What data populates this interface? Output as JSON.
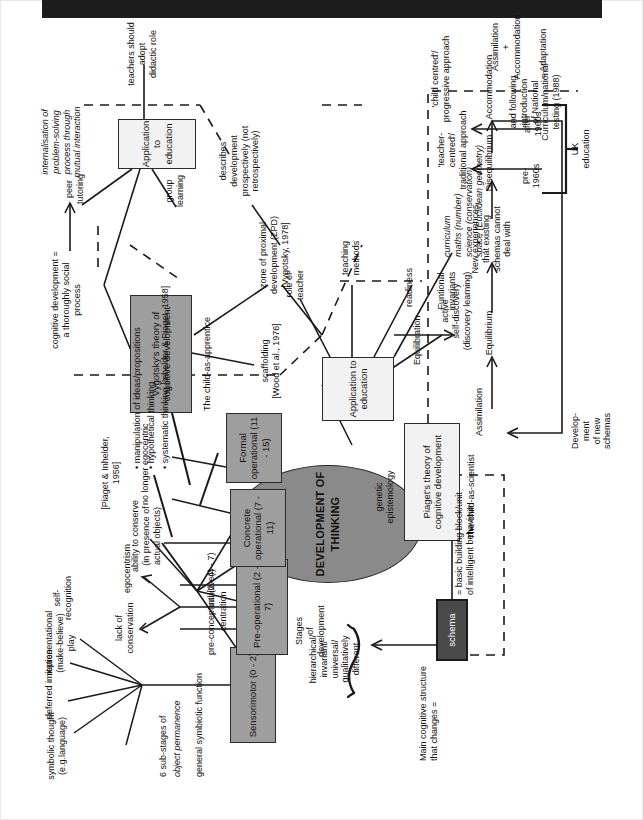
{
  "document": {
    "type": "concept-map",
    "orientation": "rotated-90-ccw",
    "scan_bar": "black-scan-edge"
  },
  "central": {
    "title": "DEVELOPMENT\nOF\nTHINKING"
  },
  "theories": {
    "piaget": {
      "box": "Piaget's theory of\ncognitive\ndevelopment",
      "metaphor": "The child-as-scientist",
      "epistemology": "genetic\nepistemology"
    },
    "vygotsky": {
      "box": "Vygotsky's theory of\ncognitive\ndevelopment",
      "metaphor": "The child-as-apprentice",
      "definition": "cognitive development =\na thoroughly social\nprocess",
      "definition2": "internalisation of\nproblem-solving\nprocess through\nmutual interaction"
    }
  },
  "schema": {
    "box": "schema",
    "main_structure": "Main cognitive structure\nthat changes =",
    "basic_unit": "= basic  building block/unit\nof intelligent behaviour"
  },
  "stages": {
    "heading": "Stages\nof\ndevelopment",
    "qualities": "hierarchical/\ninvariant/\nuniversal/\nqualitatively\ndifferent",
    "items": [
      {
        "name": "Sensorimotor\n(0 - 2)",
        "notes": [
          "6 sub-stages of",
          "object permanence",
          "general symbiotic function"
        ],
        "branches": [
          "symbolic thought\n(e.g.language)",
          "deferred imitation",
          "representational\n(make-believe)\nplay",
          "self-\nrecognition"
        ]
      },
      {
        "name": "Pre-operational\n(2 - 7)",
        "sub": [
          "pre-conceptual (2 - 4)",
          "centration",
          "intuitive(4 - 7)"
        ],
        "branches": [
          "lack of\nconservation",
          "egocentrism"
        ],
        "citation": "[Piaget & Inhelder,\n1956]"
      },
      {
        "name": "Concrete\noperational\n(7 - 11)",
        "branches": [
          "ability to conserve\n(in presence of\nactual objects)",
          "no longer egocentric"
        ]
      },
      {
        "name": "Formal\noperational\n(11 - 15)",
        "bullets": [
          "• manipulation of  ideas/propositions",
          "• hypothetical thinking",
          "• systematic thinking [Inhelder & Piaget, 1958]"
        ]
      }
    ]
  },
  "equilibration": {
    "label": "Equilibration",
    "functional_invariants": "Funtional\ninvariants",
    "cycle": [
      "Equilibrium",
      "New experiences\nthat existing\nschemas cannot\ndeal with",
      "Disequilibrium",
      "Accommodation"
    ],
    "assimilation_edge": "Assimilation",
    "feedback": "Develop-\nment\nof new\nschemas",
    "adaptation": "Assimilation\n+\nAccommodation",
    "adaptation_equals": "= Adaptation"
  },
  "application_piaget": {
    "box": "Application to\neducation",
    "branches": [
      "role of\nteacher",
      "teaching\nmethods",
      "readiness",
      "active\nself-discovery\n(discovery learning)",
      "curriculum\nmaths (number)\nscience (conservation)\nspace (Euclidean geometry)"
    ]
  },
  "application_vygotsky": {
    "box": "Application to\neducation",
    "branches": [
      "peer\ntutoring",
      "group\nlearning",
      "teachers should\nadopt\ndidactic role"
    ]
  },
  "zpd": {
    "scaffolding": "scaffolding\n[Wood et al., 1976]",
    "zone": "zone of proximal\ndevelopment (ZPD)\n[Vygotsky, 1978]",
    "describes": "describes\ndevelopment\nprospectively (not\nretrospectively)"
  },
  "uk_education": {
    "label": "UK\neducation",
    "before": "pre-\n1960s",
    "before_detail": "and following\nintroduction\nof National\nCurriculum/national\ntesting (1988)",
    "before_result": "'teacher-\ncentred'/\ntraditional approach",
    "after": "after\n1960s",
    "after_result": "'child centred'/\nprogressive approach"
  }
}
